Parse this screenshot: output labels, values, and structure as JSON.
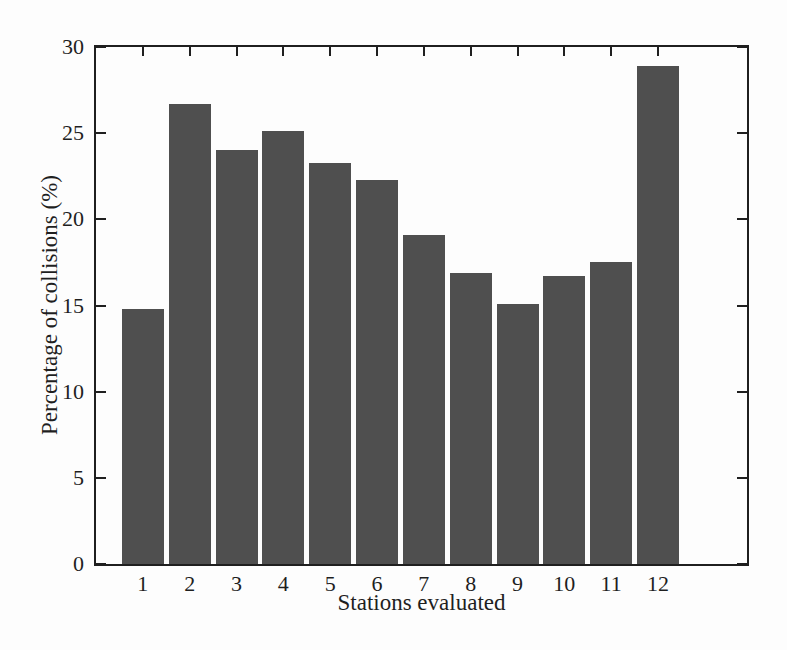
{
  "figure": {
    "background_color": "#fdfdfd",
    "bar_color": "#4f4f4f",
    "axis_color": "#1f1f1f",
    "text_color": "#1f1f1f"
  },
  "chart_data": {
    "type": "bar",
    "title": "",
    "xlabel": "Stations evaluated",
    "ylabel": "Percentage of collisions (%)",
    "categories": [
      "1",
      "2",
      "3",
      "4",
      "5",
      "6",
      "7",
      "8",
      "9",
      "10",
      "11",
      "12"
    ],
    "values": [
      14.8,
      26.7,
      24.0,
      25.1,
      23.3,
      22.3,
      19.1,
      16.9,
      15.1,
      16.7,
      17.5,
      28.9
    ],
    "ylim": [
      0,
      30
    ],
    "yticks": [
      0,
      5,
      10,
      15,
      20,
      25,
      30
    ],
    "xlim": [
      0,
      13.9
    ],
    "grid": false,
    "legend": "none",
    "box": true,
    "tick_direction": "in"
  }
}
